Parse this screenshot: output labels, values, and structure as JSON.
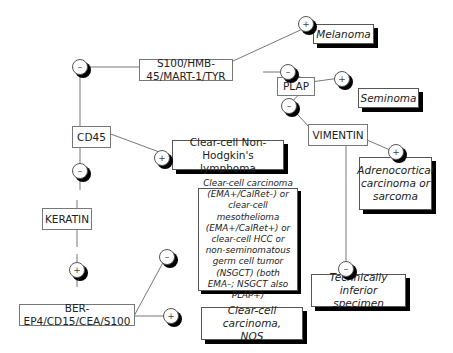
{
  "diagram": {
    "markers": {
      "s100": "S100/HMB-45/MART-1/TYR",
      "plap": "PLAP",
      "cd45": "CD45",
      "vimentin": "VIMENTIN",
      "keratin": "KERATIN",
      "berep4": "BER-EP4/CD15/CEA/S100"
    },
    "results": {
      "melanoma": "Melanoma",
      "seminoma": "Seminoma",
      "lymphoma": "Clear-cell Non-Hodgkin's lymphoma",
      "adrenocortical": "Adrenocortical carcinoma or sarcoma",
      "clear_cell_group": "Clear-cell carcinoma (EMA+/CalRet–) or clear-cell mesothelioma (EMA+/CalRet+) or clear-cell HCC or non-seminomatous germ cell tumor (NSGCT) (both EMA–; NSGCT also PLAP+)",
      "technically_inferior": "Technically inferior specimen",
      "clear_cell_nos": "Clear-cell carcinoma, NOS"
    },
    "signs": {
      "positive": "+",
      "negative": "–"
    }
  }
}
